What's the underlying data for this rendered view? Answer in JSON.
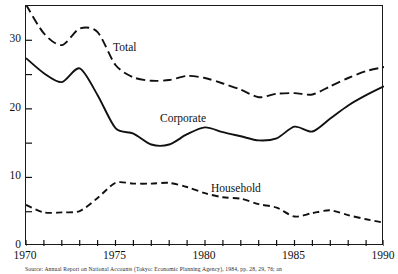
{
  "figure": {
    "background": "#ffffff",
    "line_color": "#111111"
  },
  "source_caption": "Source: Annual Report on National Accounts (Tokyo: Economic Planning Agency), 1984, pp. 28, 29, 76; an",
  "axes": {
    "y_labels": [
      "0",
      "10",
      "20",
      "30"
    ],
    "y_values": [
      0,
      10,
      20,
      30
    ],
    "y_minor_values": [
      5,
      15,
      25,
      35
    ],
    "x_labels": [
      "1970",
      "1975",
      "1980",
      "1985",
      "1990"
    ],
    "x_label_values": [
      1970,
      1975,
      1980,
      1985,
      1990
    ],
    "x_tick_values": [
      1970,
      1971,
      1972,
      1973,
      1974,
      1975,
      1976,
      1977,
      1978,
      1979,
      1980,
      1981,
      1982,
      1983,
      1984,
      1985,
      1986,
      1987,
      1988,
      1989,
      1990
    ]
  },
  "series_labels": {
    "total": "Total",
    "corporate": "Corporate",
    "household": "Household"
  },
  "chart_data": {
    "type": "line",
    "title": "",
    "xlabel": "",
    "ylabel": "",
    "xlim": [
      1970,
      1990
    ],
    "ylim": [
      0,
      35
    ],
    "grid": false,
    "legend": "inline-labels",
    "x": [
      1970,
      1971,
      1972,
      1973,
      1974,
      1975,
      1976,
      1977,
      1978,
      1979,
      1980,
      1981,
      1982,
      1983,
      1984,
      1985,
      1986,
      1987,
      1988,
      1989,
      1990
    ],
    "series": [
      {
        "name": "Total",
        "style": "long-dashed",
        "values": [
          35.2,
          31.0,
          29.3,
          31.7,
          31.2,
          26.4,
          24.6,
          24.1,
          24.2,
          24.8,
          24.5,
          23.7,
          22.8,
          21.7,
          22.2,
          22.3,
          22.1,
          23.3,
          24.5,
          25.5,
          26.1
        ]
      },
      {
        "name": "Corporate",
        "style": "solid",
        "values": [
          27.4,
          25.2,
          23.9,
          25.9,
          22.0,
          17.2,
          16.4,
          14.8,
          14.8,
          16.3,
          17.3,
          16.6,
          16.0,
          15.4,
          15.7,
          17.4,
          16.7,
          18.6,
          20.5,
          22.0,
          23.3
        ]
      },
      {
        "name": "Household",
        "style": "short-dashed",
        "values": [
          6.0,
          4.9,
          4.9,
          5.1,
          7.0,
          9.2,
          9.1,
          9.1,
          9.2,
          8.6,
          7.7,
          7.1,
          6.9,
          6.1,
          5.6,
          4.3,
          4.8,
          5.2,
          4.5,
          3.9,
          3.4
        ]
      }
    ]
  }
}
